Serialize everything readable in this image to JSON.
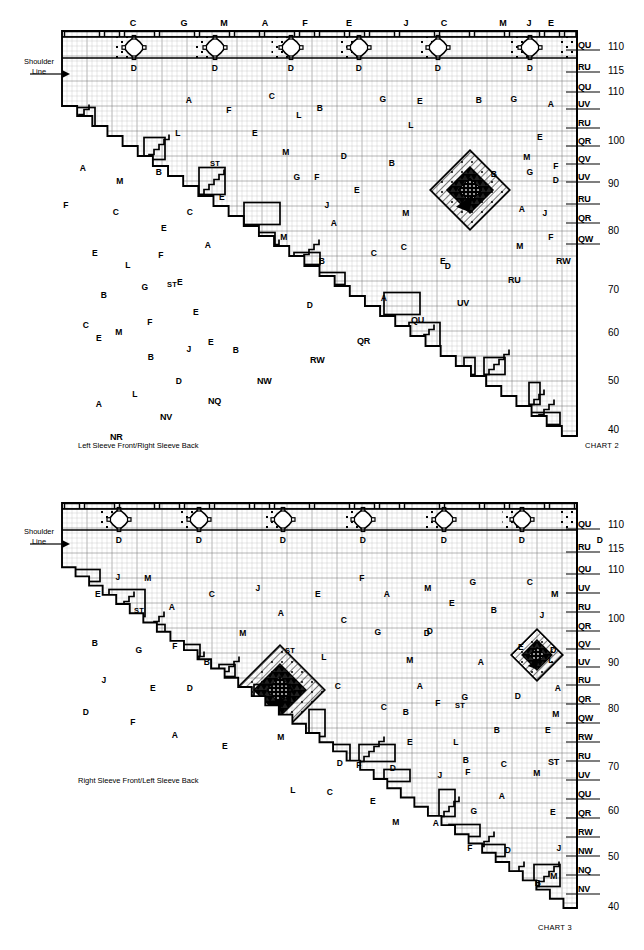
{
  "page": {
    "width": 644,
    "height": 950,
    "background": "#ffffff",
    "ink": "#000000"
  },
  "charts": [
    {
      "id": "chart2",
      "chart_id_label": "CHART 2",
      "caption": "Left Sleeve Front/Right Sleeve Back",
      "shoulder_label_line1": "Shoulder",
      "shoulder_label_line2": "Line",
      "column_letters": [
        "C",
        "G",
        "M",
        "A",
        "F",
        "E",
        "J",
        "C",
        "M",
        "J",
        "E"
      ],
      "column_letter_x": [
        133,
        184,
        224,
        265,
        305,
        349,
        406,
        444,
        503,
        529,
        551
      ],
      "diamond_letter": "D",
      "diamond_count": 6,
      "diamond_x": [
        134,
        215,
        291,
        359,
        438,
        530
      ],
      "row_labels": [
        "QU",
        "RU",
        "QU",
        "UV",
        "RU",
        "QR",
        "QV",
        "UV",
        "RU",
        "QR",
        "QW"
      ],
      "row_label_y": [
        46,
        68,
        88,
        105,
        124,
        142,
        160,
        178,
        200,
        219,
        240
      ],
      "row_numbers": [
        "110",
        "115",
        "110",
        "100",
        "90",
        "80",
        "70",
        "60",
        "50",
        "40"
      ],
      "row_number_y": [
        41,
        65,
        86,
        135,
        178,
        225,
        284,
        327,
        375,
        424
      ],
      "edge_labels": [
        {
          "text": "RW",
          "x": 556,
          "y": 256
        },
        {
          "text": "RU",
          "x": 508,
          "y": 275
        },
        {
          "text": "UV",
          "x": 457,
          "y": 298
        },
        {
          "text": "QU",
          "x": 411,
          "y": 315
        },
        {
          "text": "QR",
          "x": 357,
          "y": 336
        },
        {
          "text": "RW",
          "x": 310,
          "y": 355
        },
        {
          "text": "NW",
          "x": 257,
          "y": 376
        },
        {
          "text": "NQ",
          "x": 208,
          "y": 396
        },
        {
          "text": "NV",
          "x": 160,
          "y": 412
        },
        {
          "text": "NR",
          "x": 110,
          "y": 432
        }
      ],
      "cell_letters": [
        {
          "t": "A",
          "x": 189,
          "y": 100
        },
        {
          "t": "C",
          "x": 272,
          "y": 96
        },
        {
          "t": "B",
          "x": 320,
          "y": 108
        },
        {
          "t": "G",
          "x": 383,
          "y": 99
        },
        {
          "t": "E",
          "x": 420,
          "y": 101
        },
        {
          "t": "B",
          "x": 479,
          "y": 100
        },
        {
          "t": "G",
          "x": 514,
          "y": 99
        },
        {
          "t": "A",
          "x": 551,
          "y": 104
        },
        {
          "t": "F",
          "x": 229,
          "y": 110
        },
        {
          "t": "L",
          "x": 299,
          "y": 115
        },
        {
          "t": "L",
          "x": 178,
          "y": 133
        },
        {
          "t": "E",
          "x": 255,
          "y": 133
        },
        {
          "t": "L",
          "x": 411,
          "y": 125
        },
        {
          "t": "E",
          "x": 540,
          "y": 137
        },
        {
          "t": "A",
          "x": 83,
          "y": 168
        },
        {
          "t": "M",
          "x": 120,
          "y": 181
        },
        {
          "t": "B",
          "x": 159,
          "y": 172
        },
        {
          "t": "ST",
          "x": 215,
          "y": 163
        },
        {
          "t": "M",
          "x": 286,
          "y": 152
        },
        {
          "t": "B",
          "x": 392,
          "y": 163
        },
        {
          "t": "D",
          "x": 344,
          "y": 156
        },
        {
          "t": "D",
          "x": 556,
          "y": 180
        },
        {
          "t": "F",
          "x": 66,
          "y": 205
        },
        {
          "t": "C",
          "x": 116,
          "y": 212
        },
        {
          "t": "C",
          "x": 190,
          "y": 212
        },
        {
          "t": "E",
          "x": 222,
          "y": 197
        },
        {
          "t": "B",
          "x": 494,
          "y": 174
        },
        {
          "t": "G",
          "x": 530,
          "y": 172
        },
        {
          "t": "F",
          "x": 556,
          "y": 166
        },
        {
          "t": "M",
          "x": 527,
          "y": 157
        },
        {
          "t": "G",
          "x": 297,
          "y": 177
        },
        {
          "t": "F",
          "x": 317,
          "y": 177
        },
        {
          "t": "J",
          "x": 327,
          "y": 205
        },
        {
          "t": "E",
          "x": 357,
          "y": 190
        },
        {
          "t": "A",
          "x": 334,
          "y": 223
        },
        {
          "t": "M",
          "x": 406,
          "y": 213
        },
        {
          "t": "C",
          "x": 404,
          "y": 247
        },
        {
          "t": "A",
          "x": 522,
          "y": 209
        },
        {
          "t": "J",
          "x": 545,
          "y": 213
        },
        {
          "t": "E",
          "x": 164,
          "y": 228
        },
        {
          "t": "F",
          "x": 161,
          "y": 255
        },
        {
          "t": "A",
          "x": 208,
          "y": 245
        },
        {
          "t": "M",
          "x": 284,
          "y": 237
        },
        {
          "t": "B",
          "x": 322,
          "y": 261
        },
        {
          "t": "C",
          "x": 374,
          "y": 253
        },
        {
          "t": "M",
          "x": 520,
          "y": 246
        },
        {
          "t": "D",
          "x": 448,
          "y": 266
        },
        {
          "t": "F",
          "x": 551,
          "y": 237
        },
        {
          "t": "E",
          "x": 95,
          "y": 253
        },
        {
          "t": "L",
          "x": 128,
          "y": 265
        },
        {
          "t": "E",
          "x": 180,
          "y": 282
        },
        {
          "t": "G",
          "x": 145,
          "y": 287
        },
        {
          "t": "ST",
          "x": 172,
          "y": 284
        },
        {
          "t": "D",
          "x": 310,
          "y": 305
        },
        {
          "t": "A",
          "x": 384,
          "y": 298
        },
        {
          "t": "E",
          "x": 443,
          "y": 261
        },
        {
          "t": "B",
          "x": 104,
          "y": 295
        },
        {
          "t": "C",
          "x": 86,
          "y": 325
        },
        {
          "t": "M",
          "x": 119,
          "y": 332
        },
        {
          "t": "F",
          "x": 150,
          "y": 322
        },
        {
          "t": "E",
          "x": 196,
          "y": 312
        },
        {
          "t": "E",
          "x": 211,
          "y": 342
        },
        {
          "t": "J",
          "x": 189,
          "y": 349
        },
        {
          "t": "B",
          "x": 236,
          "y": 350
        },
        {
          "t": "E",
          "x": 99,
          "y": 338
        },
        {
          "t": "B",
          "x": 151,
          "y": 357
        },
        {
          "t": "D",
          "x": 179,
          "y": 381
        },
        {
          "t": "L",
          "x": 135,
          "y": 394
        },
        {
          "t": "A",
          "x": 99,
          "y": 404
        }
      ]
    },
    {
      "id": "chart3",
      "chart_id_label": "CHART 3",
      "caption": "Right Sleeve Front/Left Sleeve Back",
      "shoulder_label_line1": "Shoulder",
      "shoulder_label_line2": "Line",
      "column_letters": [
        "A",
        "G",
        "B",
        "E",
        "G",
        "B",
        "L",
        "C",
        "F",
        "A"
      ],
      "column_letter_x": [
        96,
        148,
        203,
        253,
        307,
        357,
        402,
        444,
        494,
        541
      ],
      "diamond_letter": "D",
      "diamond_count": 7,
      "diamond_x": [
        119,
        199,
        283,
        363,
        444,
        522,
        600
      ],
      "row_labels": [
        "QU",
        "RU",
        "QU",
        "UV",
        "RU",
        "QR",
        "QV",
        "UV",
        "RU",
        "QR",
        "QW",
        "RW",
        "RU",
        "UV",
        "QU",
        "QR",
        "RW",
        "NW",
        "NQ",
        "NV"
      ],
      "row_label_y": [
        525,
        548,
        570,
        589,
        608,
        627,
        645,
        663,
        681,
        700,
        719,
        738,
        757,
        776,
        795,
        814,
        833,
        852,
        871,
        890
      ],
      "row_numbers": [
        "110",
        "115",
        "110",
        "100",
        "90",
        "80",
        "70",
        "60",
        "50",
        "40"
      ],
      "row_number_y": [
        519,
        543,
        564,
        613,
        657,
        703,
        761,
        805,
        851,
        901
      ],
      "edge_labels": [
        {
          "text": "M",
          "x": 551,
          "y": 589
        },
        {
          "text": "D",
          "x": 550,
          "y": 645
        },
        {
          "text": "ST",
          "x": 548,
          "y": 757
        },
        {
          "text": "M",
          "x": 550,
          "y": 871
        }
      ],
      "cell_letters": [
        {
          "t": "E",
          "x": 98,
          "y": 594
        },
        {
          "t": "J",
          "x": 118,
          "y": 577
        },
        {
          "t": "M",
          "x": 148,
          "y": 578
        },
        {
          "t": "ST",
          "x": 139,
          "y": 610
        },
        {
          "t": "A",
          "x": 172,
          "y": 607
        },
        {
          "t": "C",
          "x": 212,
          "y": 594
        },
        {
          "t": "J",
          "x": 258,
          "y": 588
        },
        {
          "t": "A",
          "x": 281,
          "y": 613
        },
        {
          "t": "E",
          "x": 318,
          "y": 594
        },
        {
          "t": "C",
          "x": 344,
          "y": 620
        },
        {
          "t": "F",
          "x": 362,
          "y": 578
        },
        {
          "t": "A",
          "x": 387,
          "y": 594
        },
        {
          "t": "M",
          "x": 428,
          "y": 588
        },
        {
          "t": "E",
          "x": 452,
          "y": 603
        },
        {
          "t": "G",
          "x": 473,
          "y": 582
        },
        {
          "t": "C",
          "x": 530,
          "y": 582
        },
        {
          "t": "B",
          "x": 95,
          "y": 643
        },
        {
          "t": "G",
          "x": 139,
          "y": 650
        },
        {
          "t": "F",
          "x": 175,
          "y": 646
        },
        {
          "t": "B",
          "x": 207,
          "y": 662
        },
        {
          "t": "M",
          "x": 243,
          "y": 633
        },
        {
          "t": "ST",
          "x": 290,
          "y": 650
        },
        {
          "t": "L",
          "x": 324,
          "y": 657
        },
        {
          "t": "G",
          "x": 378,
          "y": 632
        },
        {
          "t": "D",
          "x": 427,
          "y": 633
        },
        {
          "t": "B",
          "x": 494,
          "y": 610
        },
        {
          "t": "J",
          "x": 542,
          "y": 615
        },
        {
          "t": "D",
          "x": 430,
          "y": 631
        },
        {
          "t": "A",
          "x": 481,
          "y": 662
        },
        {
          "t": "E",
          "x": 521,
          "y": 647
        },
        {
          "t": "J",
          "x": 104,
          "y": 680
        },
        {
          "t": "E",
          "x": 153,
          "y": 688
        },
        {
          "t": "D",
          "x": 86,
          "y": 712
        },
        {
          "t": "F",
          "x": 133,
          "y": 722
        },
        {
          "t": "A",
          "x": 175,
          "y": 735
        },
        {
          "t": "D",
          "x": 190,
          "y": 688
        },
        {
          "t": "M",
          "x": 410,
          "y": 660
        },
        {
          "t": "C",
          "x": 338,
          "y": 686
        },
        {
          "t": "A",
          "x": 420,
          "y": 686
        },
        {
          "t": "L",
          "x": 551,
          "y": 660
        },
        {
          "t": "A",
          "x": 558,
          "y": 688
        },
        {
          "t": "F",
          "x": 438,
          "y": 703
        },
        {
          "t": "C",
          "x": 384,
          "y": 707
        },
        {
          "t": "B",
          "x": 406,
          "y": 712
        },
        {
          "t": "G",
          "x": 465,
          "y": 697
        },
        {
          "t": "D",
          "x": 518,
          "y": 696
        },
        {
          "t": "ST",
          "x": 460,
          "y": 705
        },
        {
          "t": "M",
          "x": 556,
          "y": 714
        },
        {
          "t": "E",
          "x": 225,
          "y": 746
        },
        {
          "t": "M",
          "x": 281,
          "y": 737
        },
        {
          "t": "E",
          "x": 410,
          "y": 742
        },
        {
          "t": "L",
          "x": 456,
          "y": 742
        },
        {
          "t": "B",
          "x": 497,
          "y": 730
        },
        {
          "t": "E",
          "x": 548,
          "y": 730
        },
        {
          "t": "D",
          "x": 340,
          "y": 763
        },
        {
          "t": "B",
          "x": 466,
          "y": 760
        },
        {
          "t": "L",
          "x": 293,
          "y": 790
        },
        {
          "t": "C",
          "x": 330,
          "y": 792
        },
        {
          "t": "F",
          "x": 359,
          "y": 765
        },
        {
          "t": "D",
          "x": 393,
          "y": 768
        },
        {
          "t": "J",
          "x": 440,
          "y": 775
        },
        {
          "t": "F",
          "x": 468,
          "y": 772
        },
        {
          "t": "C",
          "x": 504,
          "y": 764
        },
        {
          "t": "M",
          "x": 537,
          "y": 773
        },
        {
          "t": "E",
          "x": 373,
          "y": 801
        },
        {
          "t": "M",
          "x": 396,
          "y": 822
        },
        {
          "t": "A",
          "x": 436,
          "y": 823
        },
        {
          "t": "G",
          "x": 474,
          "y": 811
        },
        {
          "t": "A",
          "x": 502,
          "y": 796
        },
        {
          "t": "E",
          "x": 553,
          "y": 812
        },
        {
          "t": "F",
          "x": 470,
          "y": 848
        },
        {
          "t": "D",
          "x": 508,
          "y": 850
        },
        {
          "t": "J",
          "x": 559,
          "y": 848
        },
        {
          "t": "B",
          "x": 538,
          "y": 883
        }
      ]
    }
  ],
  "icons": {
    "shoulder_arrow": "arrow-right-icon"
  }
}
